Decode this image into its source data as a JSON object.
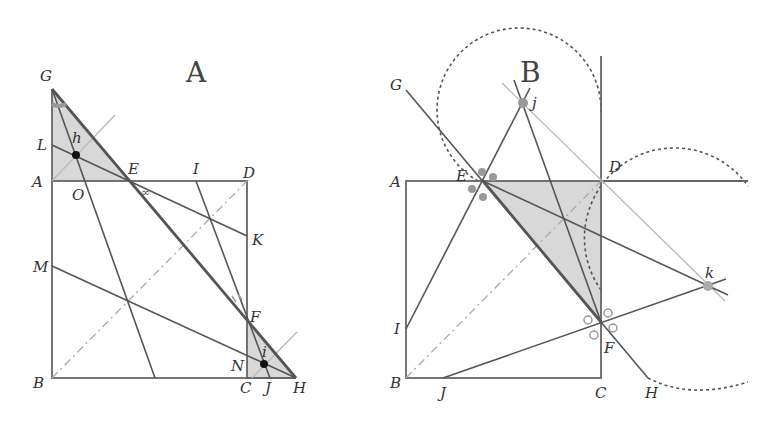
{
  "diagrams": [
    {
      "id": "A",
      "title": "A",
      "points": {
        "G": [
          52,
          89
        ],
        "A": [
          52,
          181
        ],
        "D": [
          247,
          181
        ],
        "B": [
          52,
          378
        ],
        "C": [
          247,
          378
        ],
        "H": [
          296,
          378
        ],
        "E": [
          127,
          181
        ],
        "F": [
          247,
          322
        ],
        "L": [
          52,
          145
        ],
        "M": [
          52,
          266
        ],
        "K": [
          247,
          236
        ],
        "I": [
          196,
          181
        ],
        "O": [
          78,
          181
        ],
        "N": [
          247,
          350
        ],
        "J": [
          270,
          378
        ],
        "h": [
          76,
          155
        ],
        "i": [
          264,
          364
        ]
      },
      "labels": [
        {
          "text": "G",
          "x": 40,
          "y": 81
        },
        {
          "text": "A",
          "x": 32,
          "y": 187
        },
        {
          "text": "L",
          "x": 37,
          "y": 150
        },
        {
          "text": "h",
          "x": 72,
          "y": 143
        },
        {
          "text": "O",
          "x": 72,
          "y": 200
        },
        {
          "text": "E",
          "x": 128,
          "y": 174
        },
        {
          "text": "I",
          "x": 193,
          "y": 174
        },
        {
          "text": "D",
          "x": 243,
          "y": 178
        },
        {
          "text": "K",
          "x": 252,
          "y": 245
        },
        {
          "text": "M",
          "x": 33,
          "y": 272
        },
        {
          "text": "F",
          "x": 250,
          "y": 322
        },
        {
          "text": "N",
          "x": 231,
          "y": 371
        },
        {
          "text": "i",
          "x": 262,
          "y": 357
        },
        {
          "text": "B",
          "x": 33,
          "y": 388
        },
        {
          "text": "C",
          "x": 240,
          "y": 393
        },
        {
          "text": "J",
          "x": 265,
          "y": 393
        },
        {
          "text": "H",
          "x": 293,
          "y": 393
        }
      ],
      "marks": {
        "angle_mark_E": "∞",
        "tick_mark_EF": "⁄⁄"
      }
    },
    {
      "id": "B",
      "title": "B",
      "points": {
        "A": [
          406,
          181
        ],
        "D": [
          601,
          181
        ],
        "B": [
          406,
          378
        ],
        "C": [
          601,
          378
        ],
        "E": [
          483,
          181
        ],
        "F": [
          601,
          322
        ],
        "G": [
          406,
          90
        ],
        "H": [
          648,
          378
        ],
        "j": [
          523,
          103
        ],
        "k": [
          708,
          286
        ],
        "I": [
          406,
          329
        ],
        "J": [
          443,
          378
        ]
      },
      "labels": [
        {
          "text": "G",
          "x": 390,
          "y": 90
        },
        {
          "text": "j",
          "x": 532,
          "y": 108
        },
        {
          "text": "A",
          "x": 390,
          "y": 187
        },
        {
          "text": "E",
          "x": 456,
          "y": 181
        },
        {
          "text": "D",
          "x": 609,
          "y": 172
        },
        {
          "text": "k",
          "x": 705,
          "y": 278
        },
        {
          "text": "I",
          "x": 394,
          "y": 334
        },
        {
          "text": "F",
          "x": 604,
          "y": 353
        },
        {
          "text": "B",
          "x": 390,
          "y": 388
        },
        {
          "text": "J",
          "x": 440,
          "y": 398
        },
        {
          "text": "C",
          "x": 595,
          "y": 398
        },
        {
          "text": "H",
          "x": 645,
          "y": 398
        }
      ]
    }
  ]
}
